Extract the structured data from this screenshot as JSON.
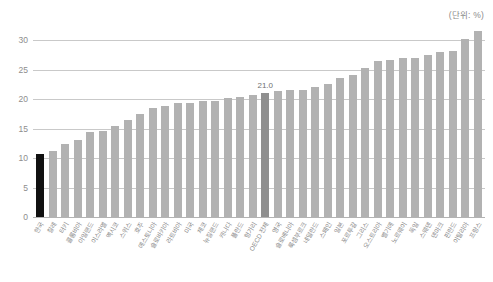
{
  "chart": {
    "unit_label": "(단위: %)",
    "highlight_value_label": "21.0"
  },
  "chart_data": {
    "type": "bar",
    "title": "",
    "subtitle": "",
    "xlabel": "",
    "ylabel": "",
    "unit": "%",
    "unit_label": "(단위: %)",
    "ylim": [
      0,
      32
    ],
    "yticks": [
      0,
      5,
      10,
      15,
      20,
      25,
      30
    ],
    "ytick_labels": [
      "0",
      "5",
      "10",
      "15",
      "20",
      "25",
      "30"
    ],
    "grid": true,
    "legend": "none",
    "orientation": "vertical",
    "sorted": "ascending",
    "bar_color": "#b2b2b2",
    "highlight_color": "#8f8f8f",
    "first_bar_color": "#111111",
    "annotations": [
      {
        "category": "OECD 전체",
        "text": "21.0"
      }
    ],
    "categories": [
      "한국",
      "칠레",
      "터키",
      "콜롬비아",
      "아일랜드",
      "이스라엘",
      "멕시코",
      "스위스",
      "호주",
      "에스토니아",
      "슬로바키아",
      "라트비아",
      "미국",
      "체코",
      "뉴질랜드",
      "캐나다",
      "폴란드",
      "헝가리",
      "OECD 전체",
      "영국",
      "슬로베니아",
      "룩셈부르크",
      "네덜란드",
      "스페인",
      "일본",
      "포르투갈",
      "그리스",
      "오스트리아",
      "벨기에",
      "노르웨이",
      "독일",
      "스웨덴",
      "덴마크",
      "핀란드",
      "이탈리아",
      "프랑스"
    ],
    "values": [
      10.7,
      11.2,
      12.4,
      13.1,
      14.4,
      14.5,
      15.4,
      16.5,
      17.4,
      18.5,
      18.9,
      19.4,
      19.4,
      19.6,
      19.6,
      20.2,
      20.3,
      20.6,
      21.0,
      21.3,
      21.5,
      21.6,
      22.0,
      22.6,
      23.5,
      24.1,
      25.3,
      26.5,
      26.6,
      27.0,
      27.0,
      27.4,
      28.0,
      28.2,
      30.1,
      31.5
    ],
    "highlight_index": 18,
    "first_bar_index": 0
  }
}
